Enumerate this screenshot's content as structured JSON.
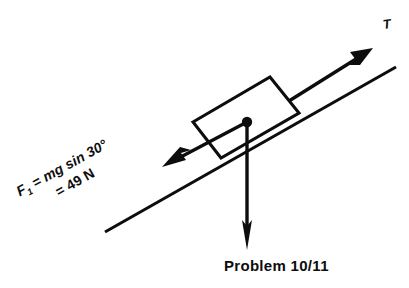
{
  "figure": {
    "caption": "Problem 10/11",
    "background_color": "#ffffff",
    "ink_color": "#0d0d0d"
  },
  "labels": {
    "tension": "T",
    "force_symbol": "F",
    "force_subscript": "1",
    "force_expression_line1": " = mg sin 30°",
    "force_expression_line2": "= 49 N",
    "force_full_text": "F₁ = mg sin 30° = 49 N"
  },
  "physics_data": {
    "incline_angle_deg": 30,
    "angle_label": "30°",
    "force_magnitude": 49,
    "force_unit": "N",
    "force_formula": "mg sin 30°",
    "vectors": [
      {
        "name": "tension",
        "symbol": "T",
        "direction": "up the incline",
        "label": "T"
      },
      {
        "name": "gravity-component-along-incline",
        "symbol": "F1",
        "direction": "down the incline",
        "label": "F₁ = mg sin 30° = 49 N",
        "magnitude": 49,
        "unit": "N"
      },
      {
        "name": "weight",
        "symbol": "W",
        "direction": "vertically downward",
        "label": ""
      }
    ]
  },
  "geometry": {
    "incline_start": [
      105,
      232
    ],
    "incline_end": [
      396,
      67
    ],
    "block_corners": [
      [
        193,
        122
      ],
      [
        270,
        77
      ],
      [
        298,
        113
      ],
      [
        220,
        158
      ]
    ],
    "origin_dot": [
      247,
      122
    ],
    "tension_arrow": [
      [
        290,
        100
      ],
      [
        371,
        49
      ]
    ],
    "friction_arrow": [
      [
        247,
        122
      ],
      [
        163,
        166
      ]
    ],
    "weight_arrow": [
      [
        247,
        122
      ],
      [
        247,
        248
      ]
    ]
  }
}
